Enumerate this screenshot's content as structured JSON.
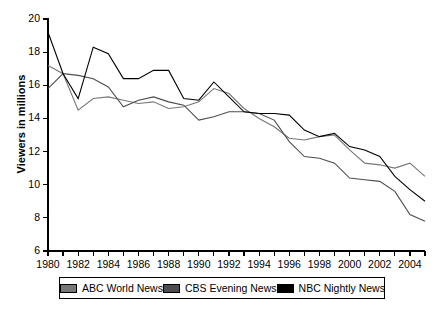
{
  "chart_data": {
    "type": "line",
    "title": "",
    "xlabel": "",
    "ylabel": "Viewers in millions",
    "xlim": [
      1980,
      2005
    ],
    "ylim": [
      6,
      20
    ],
    "yticks": [
      6,
      8,
      10,
      12,
      14,
      16,
      18,
      20
    ],
    "xticks": [
      1980,
      1981,
      1982,
      1983,
      1984,
      1985,
      1986,
      1987,
      1988,
      1989,
      1990,
      1991,
      1992,
      1993,
      1994,
      1995,
      1996,
      1997,
      1998,
      1999,
      2000,
      2001,
      2002,
      2003,
      2004,
      2005
    ],
    "xtick_labels_shown": [
      "1980",
      "1982",
      "1984",
      "1986",
      "1988",
      "1990",
      "1992",
      "1994",
      "1996",
      "1998",
      "2000",
      "2002",
      "2004"
    ],
    "grid": false,
    "legend_position": "bottom",
    "x": [
      1980,
      1981,
      1982,
      1983,
      1984,
      1985,
      1986,
      1987,
      1988,
      1989,
      1990,
      1991,
      1992,
      1993,
      1994,
      1995,
      1996,
      1997,
      1998,
      1999,
      2000,
      2001,
      2002,
      2003,
      2004,
      2005
    ],
    "series": [
      {
        "name": "ABC World News",
        "color": "#777777",
        "values": [
          17.2,
          16.7,
          14.5,
          15.2,
          15.3,
          15.1,
          14.9,
          15.0,
          14.6,
          14.7,
          15.0,
          15.8,
          15.5,
          14.6,
          14.0,
          13.5,
          12.8,
          12.7,
          12.9,
          13.0,
          12.1,
          11.3,
          11.2,
          11.0,
          11.3,
          10.5
        ]
      },
      {
        "name": "CBS Evening News",
        "color": "#4d4d4d",
        "values": [
          15.8,
          16.7,
          16.6,
          16.4,
          15.9,
          14.7,
          15.1,
          15.3,
          15.0,
          14.8,
          13.9,
          14.1,
          14.4,
          14.4,
          14.3,
          13.9,
          12.6,
          11.7,
          11.6,
          11.3,
          10.4,
          10.3,
          10.2,
          9.6,
          8.2,
          7.8
        ]
      },
      {
        "name": "NBC Nightly News",
        "color": "#000000",
        "values": [
          19.2,
          16.7,
          15.2,
          18.3,
          17.9,
          16.4,
          16.4,
          16.9,
          16.9,
          15.2,
          15.1,
          16.2,
          15.3,
          14.4,
          14.3,
          14.3,
          14.2,
          13.3,
          12.9,
          13.1,
          12.3,
          12.1,
          11.7,
          10.5,
          9.7,
          9.0
        ]
      }
    ]
  },
  "legend": {
    "entries": [
      {
        "label": "ABC World News",
        "swatch": "#777777"
      },
      {
        "label": "CBS Evening News",
        "swatch": "#4d4d4d"
      },
      {
        "label": "NBC Nightly News",
        "swatch": "#000000"
      }
    ]
  },
  "axes": {
    "y_axis_title": "Viewers in millions"
  }
}
